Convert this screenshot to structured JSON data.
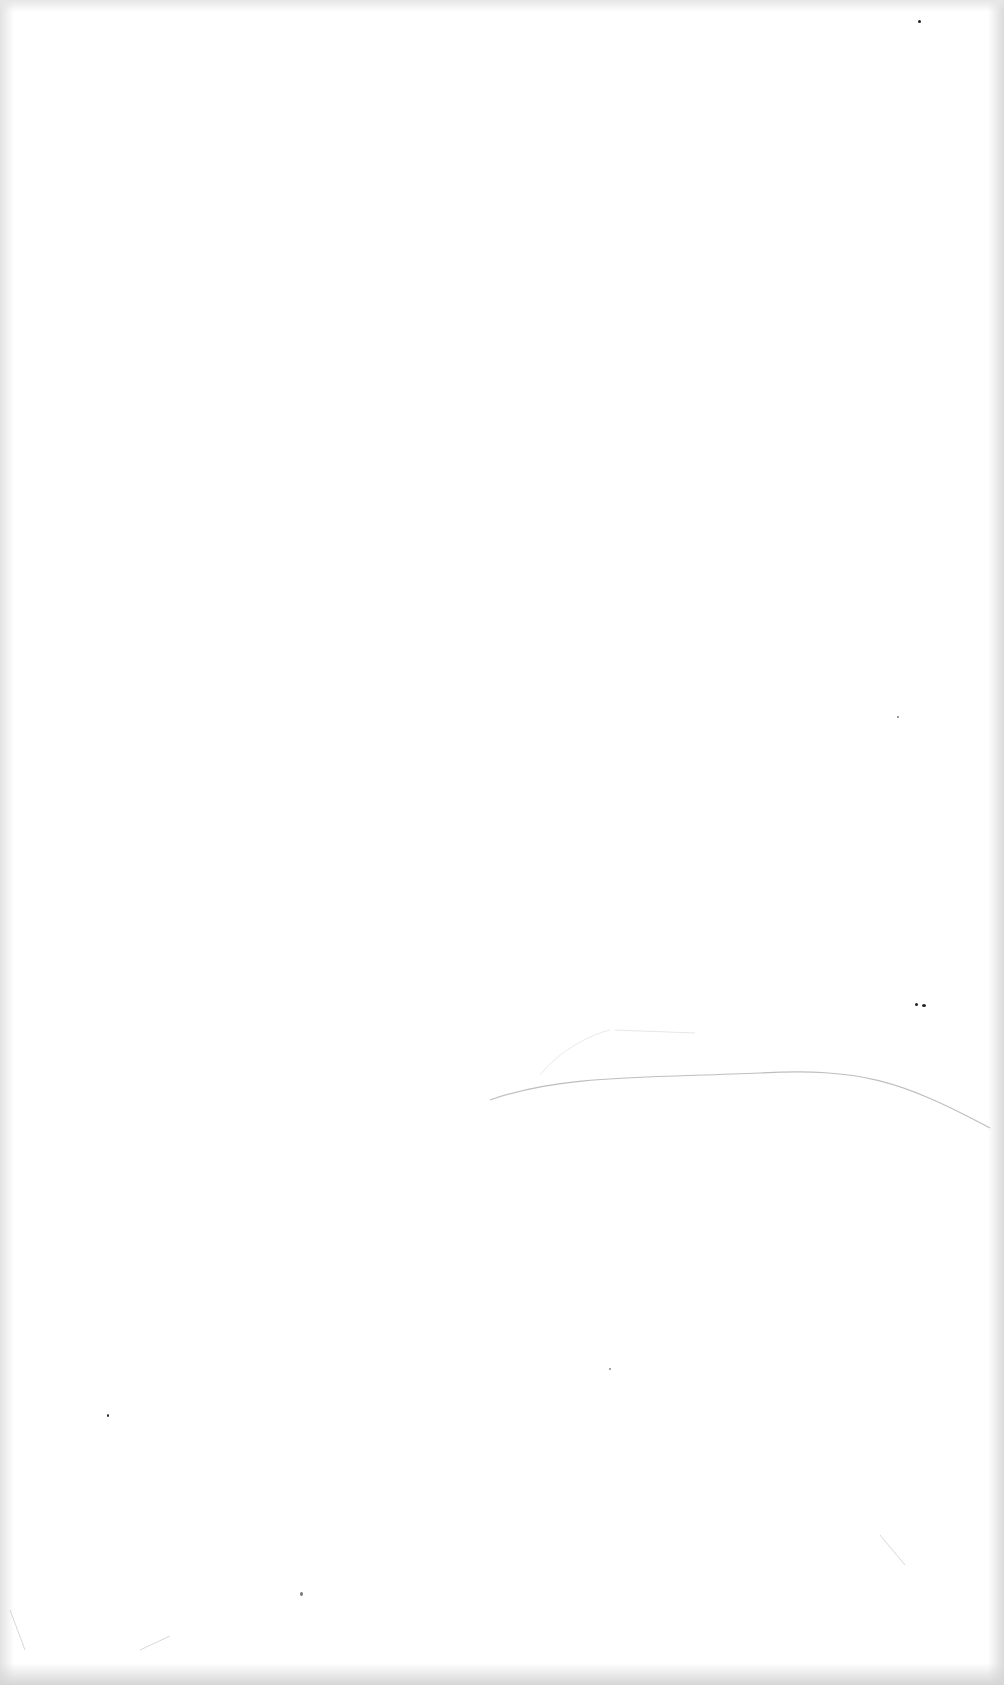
{
  "page": {
    "kind": "blank scanned page",
    "background_color": "#ffffff",
    "edge_shadow_color": "#d8d8d8",
    "mark_color": "#9a9a9a",
    "text_content": []
  }
}
